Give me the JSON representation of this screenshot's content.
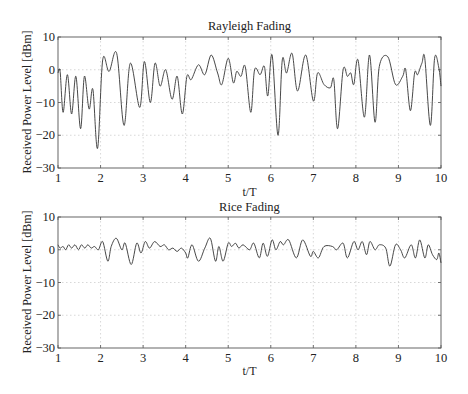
{
  "chart_data": [
    {
      "type": "line",
      "title": "Rayleigh Fading",
      "xlabel": "t/T",
      "ylabel": "Received Power Level [dBm]",
      "xlim": [
        1,
        10
      ],
      "ylim": [
        -30,
        10
      ],
      "xticks": [
        1,
        2,
        3,
        4,
        5,
        6,
        7,
        8,
        9,
        10
      ],
      "yticks": [
        -30,
        -20,
        -10,
        0,
        10
      ],
      "xtick_labels": [
        "1",
        "2",
        "3",
        "4",
        "5",
        "6",
        "7",
        "8",
        "9",
        "10"
      ],
      "ytick_labels": [
        "−30",
        "−20",
        "−10",
        "0",
        "10"
      ],
      "grid": true,
      "series": [
        {
          "name": "Rayleigh",
          "x": [
            1.0,
            1.05,
            1.12,
            1.22,
            1.32,
            1.42,
            1.53,
            1.62,
            1.73,
            1.82,
            1.93,
            2.05,
            2.2,
            2.38,
            2.55,
            2.7,
            2.92,
            3.03,
            3.17,
            3.28,
            3.4,
            3.53,
            3.68,
            3.8,
            3.92,
            4.03,
            4.13,
            4.3,
            4.45,
            4.6,
            4.75,
            4.85,
            5.0,
            5.12,
            5.2,
            5.3,
            5.4,
            5.53,
            5.62,
            5.75,
            5.85,
            5.93,
            6.03,
            6.17,
            6.27,
            6.37,
            6.5,
            6.63,
            6.82,
            7.0,
            7.1,
            7.25,
            7.4,
            7.48,
            7.57,
            7.7,
            7.8,
            7.88,
            7.95,
            8.05,
            8.2,
            8.32,
            8.45,
            8.55,
            8.75,
            8.93,
            9.1,
            9.17,
            9.28,
            9.38,
            9.45,
            9.55,
            9.62,
            9.75,
            9.85,
            9.95,
            10.0
          ],
          "y": [
            -1,
            -0.5,
            -13,
            -1.5,
            -13.5,
            -2,
            -18,
            -2,
            -12,
            -6,
            -24,
            3,
            -0.5,
            5,
            -17,
            2,
            -11.5,
            2.5,
            -10,
            2,
            -5,
            0,
            -9,
            -2,
            -13.5,
            -2,
            -3,
            1.5,
            -1.5,
            4.5,
            -1,
            -4.5,
            3.5,
            -4,
            -0.5,
            -2,
            1,
            -13,
            0,
            -1.5,
            1,
            -8,
            4.5,
            -20,
            3,
            -1,
            5,
            -6.5,
            4.5,
            -9.5,
            -1,
            -4.5,
            -5.5,
            -3,
            -18,
            0,
            -2,
            -1,
            -4.5,
            3,
            -14.5,
            4.5,
            -16,
            1,
            4,
            -4.5,
            -2,
            0,
            -12.5,
            -1,
            -1.5,
            2,
            3.5,
            -17,
            3.5,
            0.5,
            -5
          ]
        }
      ]
    },
    {
      "type": "line",
      "title": "Rice Fading",
      "xlabel": "t/T",
      "ylabel": "Received Power Level [dBm]",
      "xlim": [
        1,
        10
      ],
      "ylim": [
        -30,
        10
      ],
      "xticks": [
        1,
        2,
        3,
        4,
        5,
        6,
        7,
        8,
        9,
        10
      ],
      "yticks": [
        -30,
        -20,
        -10,
        0,
        10
      ],
      "xtick_labels": [
        "1",
        "2",
        "3",
        "4",
        "5",
        "6",
        "7",
        "8",
        "9",
        "10"
      ],
      "ytick_labels": [
        "−30",
        "−20",
        "−10",
        "0",
        "10"
      ],
      "grid": true,
      "series": [
        {
          "name": "Rice",
          "x": [
            1.0,
            1.05,
            1.12,
            1.18,
            1.25,
            1.32,
            1.4,
            1.48,
            1.55,
            1.63,
            1.7,
            1.78,
            1.86,
            1.95,
            2.05,
            2.17,
            2.25,
            2.37,
            2.5,
            2.58,
            2.72,
            2.85,
            2.95,
            3.05,
            3.15,
            3.27,
            3.4,
            3.5,
            3.6,
            3.7,
            3.8,
            3.9,
            4.0,
            4.05,
            4.15,
            4.3,
            4.45,
            4.58,
            4.7,
            4.78,
            4.88,
            5.0,
            5.08,
            5.17,
            5.25,
            5.35,
            5.5,
            5.6,
            5.73,
            5.82,
            5.92,
            6.03,
            6.12,
            6.22,
            6.3,
            6.42,
            6.6,
            6.75,
            6.93,
            7.0,
            7.12,
            7.25,
            7.45,
            7.55,
            7.7,
            7.8,
            7.95,
            8.05,
            8.15,
            8.25,
            8.33,
            8.45,
            8.55,
            8.7,
            8.8,
            8.93,
            9.05,
            9.15,
            9.3,
            9.4,
            9.5,
            9.62,
            9.7,
            9.8,
            9.9,
            9.95,
            10.0
          ],
          "y": [
            1.5,
            0.5,
            1,
            0,
            1.5,
            0.5,
            1.5,
            0,
            1.5,
            0.5,
            1.5,
            0.5,
            1,
            0,
            2.5,
            -3.5,
            1,
            3.5,
            0,
            2,
            -4.5,
            2,
            -1,
            2.5,
            0.5,
            2.5,
            1,
            1.5,
            0,
            0.5,
            -0.5,
            0.5,
            -1,
            -2.5,
            1.5,
            -3.5,
            0.5,
            3.5,
            -3.5,
            1,
            -3.5,
            2,
            1,
            2,
            0.5,
            1.5,
            0,
            2,
            -2.5,
            2,
            -2,
            3,
            0,
            2.5,
            1.5,
            3,
            -2.5,
            3,
            -2,
            -0.5,
            -2.5,
            1,
            1,
            0,
            2,
            -2.5,
            2.5,
            0,
            2.5,
            -1.5,
            2.5,
            0,
            1.5,
            0.5,
            -5,
            1.5,
            0,
            -2.5,
            1.5,
            -2.5,
            3,
            -2.5,
            1.5,
            -1.5,
            -3,
            -1,
            -4
          ]
        }
      ]
    }
  ],
  "top": {
    "title": "Rayleigh Fading",
    "xlabel": "t/T",
    "ylabel": "Received Power Level [dBm]"
  },
  "bottom": {
    "title": "Rice Fading",
    "xlabel": "t/T",
    "ylabel": "Received Power Level [dBm]"
  },
  "colors": {
    "line": "#333333",
    "frame": "#555555",
    "grid": "#bdbdbd"
  }
}
